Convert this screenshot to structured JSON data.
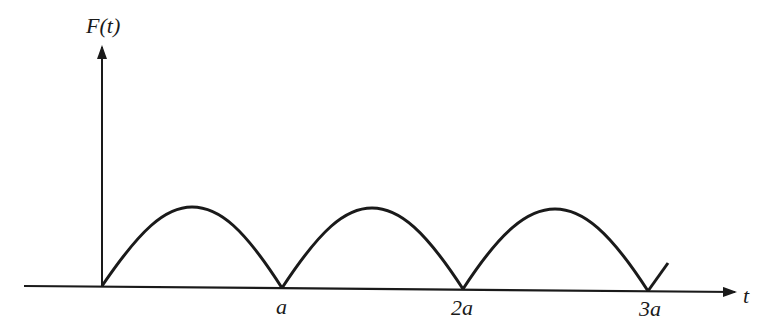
{
  "figure": {
    "y_axis_label": "F(t)",
    "x_axis_label": "t",
    "tick_labels": [
      "a",
      "2a",
      "3a"
    ]
  },
  "colors": {
    "ink": "#1a1a1a",
    "background": "#ffffff"
  }
}
